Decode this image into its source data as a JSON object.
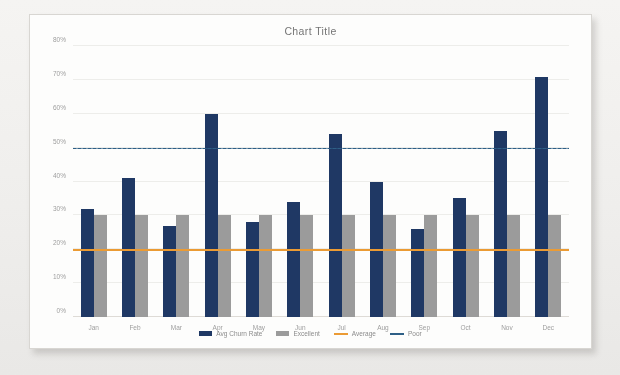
{
  "chart_data": {
    "type": "bar",
    "title": "Chart Title",
    "xlabel": "",
    "ylabel": "",
    "ylim": [
      0,
      80
    ],
    "ytick_step": 10,
    "ytick_labels": [
      "0%",
      "10%",
      "20%",
      "30%",
      "40%",
      "50%",
      "60%",
      "70%",
      "80%"
    ],
    "ytick_values": [
      0,
      10,
      20,
      30,
      40,
      50,
      60,
      70,
      80
    ],
    "grid": true,
    "legend_position": "bottom",
    "categories": [
      "Jan",
      "Feb",
      "Mar",
      "Apr",
      "May",
      "Jun",
      "Jul",
      "Aug",
      "Sep",
      "Oct",
      "Nov",
      "Dec"
    ],
    "series": [
      {
        "name": "Avg Churn Rate",
        "type": "bar",
        "color": "#1F3864",
        "values": [
          32,
          41,
          27,
          60,
          28,
          34,
          54,
          40,
          26,
          35,
          55,
          71
        ]
      },
      {
        "name": "Excellent",
        "type": "bar",
        "color": "#9B9B9B",
        "values": [
          30,
          30,
          30,
          30,
          30,
          30,
          30,
          30,
          30,
          30,
          30,
          30
        ]
      },
      {
        "name": "Average",
        "type": "line",
        "color": "#EB9B34",
        "constant": 20,
        "values": [
          20,
          20,
          20,
          20,
          20,
          20,
          20,
          20,
          20,
          20,
          20,
          20
        ]
      },
      {
        "name": "Poor",
        "type": "line",
        "color": "#2E5F86",
        "constant": 50,
        "values": [
          50,
          50,
          50,
          50,
          50,
          50,
          50,
          50,
          50,
          50,
          50,
          50
        ]
      }
    ]
  },
  "legend": [
    {
      "label": "Avg Churn Rate",
      "color": "#1F3864",
      "marker": "bar"
    },
    {
      "label": "Excellent",
      "color": "#9B9B9B",
      "marker": "bar"
    },
    {
      "label": "Average",
      "color": "#EB9B34",
      "marker": "line"
    },
    {
      "label": "Poor",
      "color": "#2E5F86",
      "marker": "line"
    }
  ],
  "colors": {
    "primary_bar": "#1F3864",
    "secondary_bar": "#9B9B9B",
    "average_line": "#EB9B34",
    "poor_line": "#2E5F86",
    "card_background": "#FDFDFC",
    "page_background": "#F2F1EF",
    "gridline": "#EDEDEA",
    "axis_text": "#8D8D8D"
  }
}
